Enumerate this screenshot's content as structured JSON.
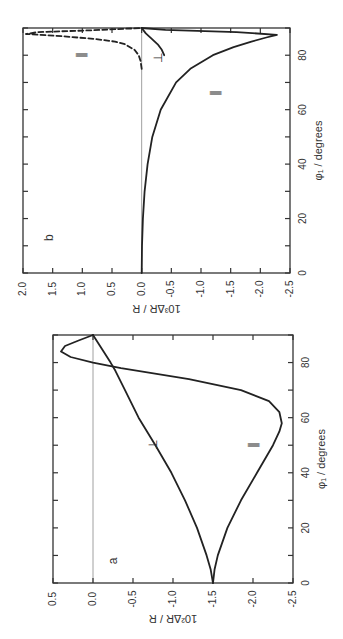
{
  "figure": {
    "orientation": "rotated 90 degrees counter-clockwise",
    "background": "#ffffff",
    "line_color": "#222222"
  },
  "chart_data": [
    {
      "panel": "a",
      "type": "line",
      "title": "",
      "xlabel": "φ1 / degrees",
      "ylabel": "10²ΔR / R",
      "xlim": [
        0,
        90
      ],
      "ylim": [
        -2.5,
        0.5
      ],
      "xticks": [
        0,
        20,
        40,
        60,
        80
      ],
      "xtick_labels": [
        "0",
        "20",
        "40",
        "60",
        "80"
      ],
      "yticks": [
        0.5,
        0.0,
        -0.5,
        -1.0,
        -1.5,
        -2.0,
        -2.5
      ],
      "ytick_labels": [
        "0.5",
        "0.0",
        "-0.5",
        "-1.0",
        "-1.5",
        "-2.0",
        "-2.5"
      ],
      "zero_line": true,
      "series": [
        {
          "name": "∥",
          "style": "solid",
          "x": [
            0,
            5,
            10,
            20,
            30,
            40,
            50,
            55,
            58,
            62,
            66,
            70,
            74,
            78,
            80,
            82,
            84,
            86,
            88,
            90
          ],
          "y": [
            -1.5,
            -1.52,
            -1.56,
            -1.68,
            -1.85,
            -2.05,
            -2.25,
            -2.33,
            -2.36,
            -2.33,
            -2.2,
            -1.85,
            -1.2,
            -0.35,
            0.0,
            0.28,
            0.4,
            0.35,
            0.18,
            0.0
          ]
        },
        {
          "name": "⊥",
          "style": "solid",
          "x": [
            0,
            5,
            10,
            20,
            30,
            40,
            50,
            60,
            70,
            77,
            80,
            85,
            90
          ],
          "y": [
            -1.5,
            -1.47,
            -1.42,
            -1.3,
            -1.15,
            -0.98,
            -0.78,
            -0.57,
            -0.4,
            -0.28,
            -0.22,
            -0.11,
            0.0
          ]
        }
      ],
      "annotations": [
        {
          "text": "a",
          "x": 8,
          "y": -0.3
        },
        {
          "text": "⊥",
          "x": 50,
          "y": -0.8
        },
        {
          "text": "∥",
          "x": 50,
          "y": -2.05
        }
      ]
    },
    {
      "panel": "b",
      "type": "line",
      "title": "",
      "xlabel": "φ1 / degrees",
      "ylabel": "10³ΔR / R",
      "xlim": [
        0,
        90
      ],
      "ylim": [
        -2.5,
        2.0
      ],
      "xticks": [
        0,
        20,
        40,
        60,
        80
      ],
      "xtick_labels": [
        "0",
        "20",
        "40",
        "60",
        "80"
      ],
      "yticks": [
        2.0,
        1.5,
        1.0,
        0.5,
        0.0,
        -0.5,
        -1.0,
        -1.5,
        -2.0,
        -2.5
      ],
      "ytick_labels": [
        "2.0",
        "1.5",
        "1.0",
        "0.5",
        "0.0",
        "-0.5",
        "-1.0",
        "-1.5",
        "-2.0",
        "-2.5"
      ],
      "zero_line": true,
      "series": [
        {
          "name": "∥ (solid)",
          "style": "solid",
          "x": [
            0,
            10,
            20,
            30,
            40,
            50,
            60,
            70,
            75,
            80,
            83,
            85,
            86.5,
            87.5,
            88.5,
            89.3,
            90
          ],
          "y": [
            0.0,
            -0.005,
            -0.02,
            -0.05,
            -0.1,
            -0.18,
            -0.32,
            -0.58,
            -0.82,
            -1.2,
            -1.55,
            -1.85,
            -2.1,
            -2.28,
            -1.6,
            -0.4,
            0.0
          ]
        },
        {
          "name": "∥ (dashed)",
          "style": "dashed",
          "x": [
            75,
            78,
            80,
            82,
            84,
            85,
            86,
            87,
            87.8,
            88.5,
            89.2,
            90
          ],
          "y": [
            0.0,
            0.02,
            0.05,
            0.12,
            0.28,
            0.45,
            0.8,
            1.35,
            1.95,
            1.75,
            0.8,
            0.0
          ]
        },
        {
          "name": "⊥",
          "style": "solid",
          "x": [
            80,
            82,
            84,
            86,
            88,
            90
          ],
          "y": [
            -0.38,
            -0.34,
            -0.27,
            -0.17,
            -0.07,
            0.0
          ]
        }
      ],
      "annotations": [
        {
          "text": "b",
          "x": 13,
          "y": 1.5
        },
        {
          "text": "∥",
          "x": 80,
          "y": 0.95
        },
        {
          "text": "⊥",
          "x": 79,
          "y": -0.35
        },
        {
          "text": "∥",
          "x": 66,
          "y": -1.3
        }
      ]
    }
  ],
  "labels": {
    "panel_a": "a",
    "panel_b": "b",
    "xlabel": "φ₁ / degrees",
    "ylabel_a": "10²ΔR / R",
    "ylabel_b": "10³ΔR / R",
    "parallel": "∥",
    "perp": "⊥"
  }
}
